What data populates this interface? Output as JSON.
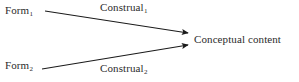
{
  "diagram": {
    "title_text": "",
    "background_color": "#ffffff",
    "stroke_color": "#1a1a1a",
    "text_color": "#2b2b2b",
    "nodes": [
      {
        "id": "form-1",
        "base": "Form",
        "subscript": "1",
        "x": 5,
        "y": 5
      },
      {
        "id": "form-2",
        "base": "Form",
        "subscript": "2",
        "x": 5,
        "y": 60
      },
      {
        "id": "conceptual-content",
        "base": "Conceptual content",
        "subscript": "",
        "x": 194,
        "y": 34
      }
    ],
    "edge_labels": [
      {
        "id": "construal-1",
        "base": "Construal",
        "subscript": "1",
        "x": 100,
        "y": 2
      },
      {
        "id": "construal-2",
        "base": "Construal",
        "subscript": "2",
        "x": 100,
        "y": 63
      }
    ],
    "arrows": [
      {
        "id": "arrow-form1-to-content",
        "x1": 45,
        "y1": 11,
        "x2": 188,
        "y2": 33
      },
      {
        "id": "arrow-form2-to-content",
        "x1": 42,
        "y1": 69,
        "x2": 188,
        "y2": 45
      }
    ]
  }
}
